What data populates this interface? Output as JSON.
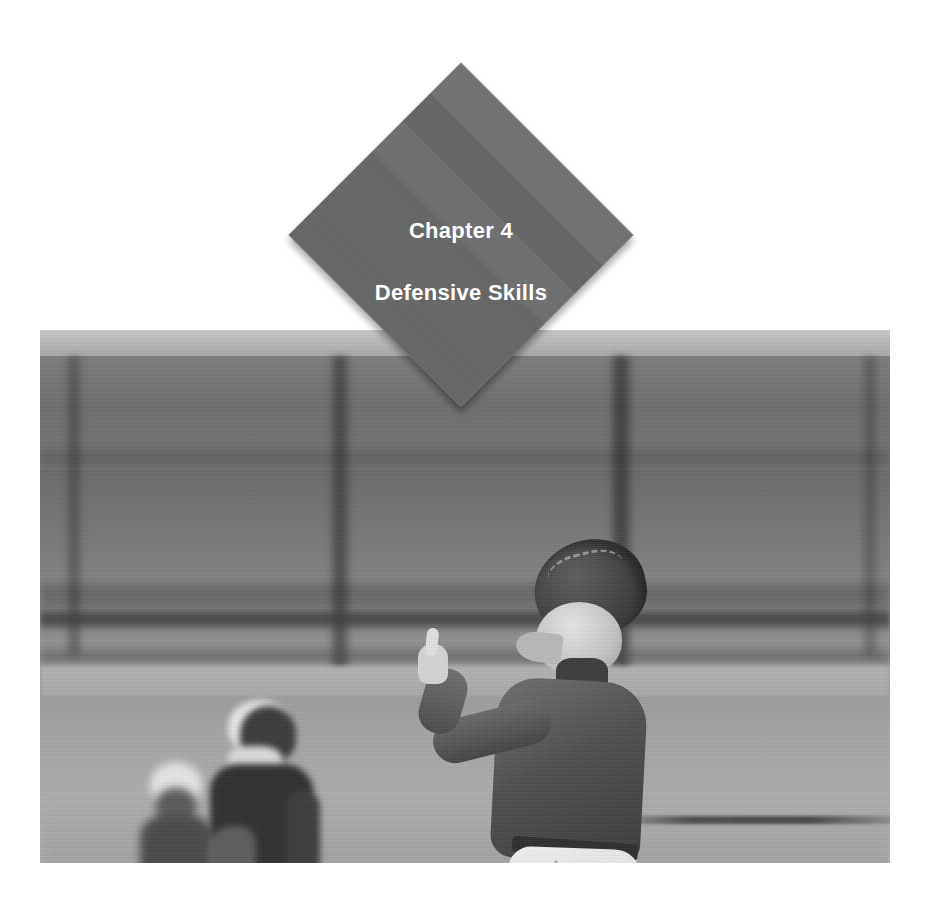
{
  "page": {
    "kind": "book-chapter-opener",
    "background_color": "#ffffff"
  },
  "chapter_badge": {
    "shape": "diamond",
    "fill_color": "#6a6a6a",
    "text_color": "#ffffff",
    "chapter_label": "Chapter 4",
    "chapter_title": "Defensive Skills"
  },
  "photo": {
    "name": "baseball-fielder-photo",
    "description": "Grayscale photograph of a youth baseball fielder standing on a base with glove raised, two blurred teammates in the background in front of a fence",
    "treatment": "grayscale",
    "subjects": [
      {
        "name": "main-fielder",
        "detail": "Player seen from behind, cap, dark jersey, white pants, glove raised overhead, one foot on base, other arm extended with index finger up"
      },
      {
        "name": "background-player-catcher",
        "detail": "Blurred player with dark helmet and dark chest protector"
      },
      {
        "name": "background-player-second",
        "detail": "Blurred player with light helmet behind and to the left"
      }
    ],
    "scene_elements": [
      {
        "name": "outfield-fence",
        "detail": "Blurred dark vertical posts and horizontal rails"
      },
      {
        "name": "infield-dirt",
        "detail": "Light gray dirt surface in foreground"
      },
      {
        "name": "base-bag",
        "detail": "White base bag under the fielder's foot"
      }
    ]
  }
}
